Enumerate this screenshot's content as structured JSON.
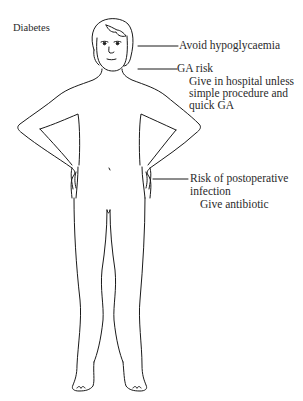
{
  "diagram": {
    "title": "Diabetes",
    "colors": {
      "line": "#1a1a1a",
      "text": "#2a2a2a",
      "background": "#ffffff"
    },
    "annotations": [
      {
        "target": "head",
        "lines": [
          "Avoid hypoglycaemia"
        ]
      },
      {
        "target": "neck",
        "lines": [
          "GA risk",
          "Give in hospital unless",
          "simple procedure and",
          "quick GA"
        ]
      },
      {
        "target": "hip",
        "lines": [
          "Risk of postoperative",
          "infection",
          "Give antibiotic"
        ]
      }
    ]
  }
}
